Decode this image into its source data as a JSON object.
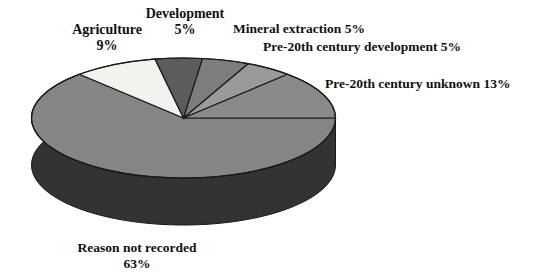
{
  "chart_data": {
    "type": "pie",
    "title": "",
    "subtitle": "",
    "xlabel": "",
    "ylabel": "",
    "legend_position": "none",
    "grid": false,
    "style": "3d-pie",
    "categories": [
      "Pre-20th century unknown",
      "Pre-20th century development",
      "Mineral extraction",
      "Development",
      "Agriculture",
      "Reason not recorded"
    ],
    "values": [
      13,
      5,
      5,
      5,
      9,
      63
    ],
    "unit": "%",
    "slices": [
      {
        "label": "Pre-20th century unknown",
        "value": 13,
        "display": "Pre-20th century unknown 13%",
        "color": "#8a8a8a",
        "side_color": "#383838"
      },
      {
        "label": "Pre-20th century development",
        "value": 5,
        "display": "Pre-20th century development 5%",
        "color": "#9a9a9a",
        "side_color": "#383838"
      },
      {
        "label": "Mineral extraction",
        "value": 5,
        "display": "Mineral extraction 5%",
        "color": "#7d7d7d",
        "side_color": "#383838"
      },
      {
        "label": "Development",
        "value": 5,
        "display": "Development 5%",
        "color": "#5c5c5c",
        "side_color": "#383838"
      },
      {
        "label": "Agriculture",
        "value": 9,
        "display": "Agriculture 9%",
        "color": "#f2f2ee",
        "side_color": "#383838"
      },
      {
        "label": "Reason not recorded",
        "value": 63,
        "display": "Reason not recorded 63%",
        "color": "#858585",
        "side_color": "#333333"
      }
    ]
  },
  "labels": {
    "agriculture": {
      "name": "Agriculture",
      "pct": "9%"
    },
    "development": {
      "name": "Development",
      "pct": "5%"
    },
    "mineral_extraction": {
      "text": "Mineral extraction 5%"
    },
    "pre20_development": {
      "text": "Pre-20th century development 5%"
    },
    "pre20_unknown": {
      "text": "Pre-20th century unknown 13%"
    },
    "reason_not_recorded": {
      "name": "Reason not recorded",
      "pct": "63%"
    }
  },
  "colors": {
    "background": "#ffffff",
    "text": "#111111",
    "outline": "#1a1a1a",
    "slice_light": "#f2f2ee",
    "slice_dark": "#5c5c5c",
    "slice_mid": "#858585",
    "side_dark": "#333333"
  }
}
